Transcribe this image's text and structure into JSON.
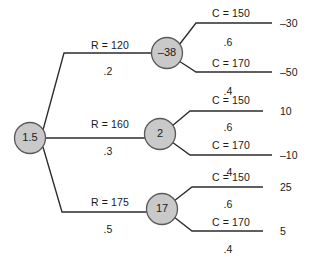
{
  "diagram": {
    "type": "decision-tree",
    "root": {
      "name": "root-node",
      "label": "1.5",
      "cx": 30,
      "cy": 138,
      "r": 15.5
    },
    "branches": [
      {
        "name": "branch-top",
        "label": "R = 120",
        "probability": ".2",
        "label_x": 110,
        "label_y": 40,
        "prob_x": 108,
        "prob_y": 66,
        "path": "M 43 130 L 64 53 L 151 53",
        "node": {
          "name": "chance-node-minus-38",
          "label": "–38",
          "cx": 167,
          "cy": 53,
          "r": 15.5
        },
        "children": [
          {
            "name": "leaf-top-c150",
            "label": "C = 150",
            "probability": ".6",
            "value": "–30",
            "label_x": 231,
            "label_y": 8,
            "prob_x": 228,
            "prob_y": 37,
            "path": "M 179 45 L 196 23 L 272 23",
            "value_x": 280,
            "value_y": 18
          },
          {
            "name": "leaf-top-c170",
            "label": "C = 170",
            "probability": ".4",
            "value": "–50",
            "label_x": 231,
            "label_y": 58,
            "prob_x": 228,
            "prob_y": 86,
            "path": "M 179 61 L 196 72 L 272 72",
            "value_x": 280,
            "value_y": 67
          }
        ]
      },
      {
        "name": "branch-middle",
        "label": "R = 160",
        "probability": ".3",
        "label_x": 110,
        "label_y": 119,
        "prob_x": 108,
        "prob_y": 146,
        "path": "M 46 138 L 145 138",
        "node": {
          "name": "chance-node-2",
          "label": "2",
          "cx": 160,
          "cy": 134,
          "r": 15.5
        },
        "children": [
          {
            "name": "leaf-middle-c150",
            "label": "C = 150",
            "probability": ".6",
            "value": "10",
            "label_x": 231,
            "label_y": 95,
            "prob_x": 228,
            "prob_y": 122,
            "path": "M 172 126 L 190 111 L 263 111",
            "value_x": 280,
            "value_y": 106
          },
          {
            "name": "leaf-middle-c170",
            "label": "C = 170",
            "probability": ".4",
            "value": "–10",
            "label_x": 231,
            "label_y": 140,
            "prob_x": 228,
            "prob_y": 167,
            "path": "M 172 142 L 190 155 L 272 155",
            "value_x": 280,
            "value_y": 150
          }
        ]
      },
      {
        "name": "branch-bottom",
        "label": "R = 175",
        "probability": ".5",
        "label_x": 110,
        "label_y": 197,
        "prob_x": 108,
        "prob_y": 224,
        "path": "M 43 147 L 62 212 L 147 212",
        "node": {
          "name": "chance-node-17",
          "label": "17",
          "cx": 162,
          "cy": 209,
          "r": 15.5
        },
        "children": [
          {
            "name": "leaf-bottom-c150",
            "label": "C = 150",
            "probability": ".6",
            "value": "25",
            "label_x": 231,
            "label_y": 172,
            "prob_x": 228,
            "prob_y": 199,
            "path": "M 174 201 L 192 187 L 263 187",
            "value_x": 280,
            "value_y": 182
          },
          {
            "name": "leaf-bottom-c170",
            "label": "C = 170",
            "probability": ".4",
            "value": "5",
            "label_x": 231,
            "label_y": 217,
            "prob_x": 228,
            "prob_y": 244,
            "path": "M 174 217 L 192 231 L 263 231",
            "value_x": 280,
            "value_y": 226
          }
        ]
      }
    ]
  }
}
